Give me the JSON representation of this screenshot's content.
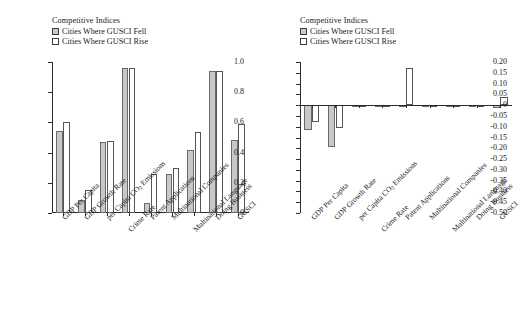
{
  "legend": {
    "title": "Competitive Indices",
    "items": [
      {
        "label": "Cities Where GUSCI Fell",
        "swatch": "filled-gray",
        "color": "#c8c8c8"
      },
      {
        "label": "Cities Where GUSCI Rise",
        "swatch": "outline-white",
        "color": "#ffffff"
      }
    ]
  },
  "categories": [
    "GDP Per Capita",
    "GDP Growth Rate",
    "per Capita CO2 Emissions",
    "Crime Rate",
    "Patent Applications",
    "Multinational Companies",
    "Multinational Language",
    "Doing Business",
    "GUSCI"
  ],
  "chart_data": [
    {
      "type": "bar",
      "panel": "left",
      "title": "",
      "xlabel": "",
      "ylabel": "",
      "categories": [
        "GDP Per Capita",
        "GDP Growth Rate",
        "per Capita CO2 Emissions",
        "Crime Rate",
        "Patent Applications",
        "Multinational Companies",
        "Multinational Language",
        "Doing Business",
        "GUSCI"
      ],
      "series": [
        {
          "name": "Cities Where GUSCI Fell",
          "values": [
            0.545,
            0.085,
            0.47,
            0.96,
            0.065,
            0.255,
            0.415,
            0.94,
            0.485
          ]
        },
        {
          "name": "Cities Where GUSCI Rise",
          "values": [
            0.605,
            0.15,
            0.475,
            0.96,
            0.26,
            0.298,
            0.535,
            0.94,
            0.588
          ]
        }
      ],
      "ylim": [
        0,
        1.0
      ],
      "yticks": [
        "0",
        "0.2",
        "0.4",
        "0.6",
        "0.8",
        "1.0"
      ],
      "ytick_values": [
        0,
        0.2,
        0.4,
        0.6,
        0.8,
        1.0
      ],
      "grid": false,
      "legend_position": "top-left"
    },
    {
      "type": "bar",
      "panel": "right",
      "title": "",
      "xlabel": "",
      "ylabel": "",
      "categories": [
        "GDP Per Capita",
        "GDP Growth Rate",
        "per Capita CO2 Emissions",
        "Crime Rate",
        "Patent Applications",
        "Multinational Companies",
        "Multinational Language",
        "Doing Business",
        "GUSCI"
      ],
      "series": [
        {
          "name": "Cities Where GUSCI Fell",
          "values": [
            -0.115,
            -0.195,
            -0.005,
            -0.004,
            0.002,
            -0.004,
            -0.003,
            -0.004,
            -0.015
          ]
        },
        {
          "name": "Cities Where GUSCI Rise",
          "values": [
            -0.08,
            -0.108,
            -0.006,
            -0.005,
            0.17,
            -0.004,
            -0.003,
            -0.004,
            0.04
          ]
        }
      ],
      "ylim": [
        -0.5,
        0.2
      ],
      "yticks": [
        "0.20",
        "0.15",
        "0.10",
        "0.05",
        "0",
        "-0.05",
        "-0.10",
        "-0.15",
        "-0.20",
        "-0.25",
        "-0.30",
        "-0.35",
        "-0.40",
        "-0.45",
        "-0.50"
      ],
      "ytick_values": [
        0.2,
        0.15,
        0.1,
        0.05,
        0,
        -0.05,
        -0.1,
        -0.15,
        -0.2,
        -0.25,
        -0.3,
        -0.35,
        -0.4,
        -0.45,
        -0.5
      ],
      "grid": false,
      "legend_position": "top-left"
    }
  ]
}
